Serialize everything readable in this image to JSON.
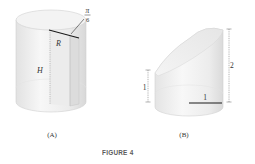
{
  "figure": {
    "caption": "FIGURE 4",
    "panels": [
      {
        "id": "A",
        "label": "(A)",
        "shape": "cylinder with wedge cut",
        "labels": {
          "angle_num": "π",
          "angle_den": "6",
          "radius": "R",
          "height": "H"
        }
      },
      {
        "id": "B",
        "label": "(B)",
        "shape": "cylinder with slanted top",
        "labels": {
          "left_height": "1",
          "right_height": "2",
          "radius": "1"
        }
      }
    ]
  },
  "colors": {
    "surface_light": "#f6f6f6",
    "surface_mid": "#e6e6e6",
    "surface_shadow": "#d4d4d4",
    "edge": "#c8c8c8",
    "line_dark": "#1a1a1a",
    "dim_line": "#555555",
    "text": "#333333",
    "caption": "#5b5b5b"
  }
}
